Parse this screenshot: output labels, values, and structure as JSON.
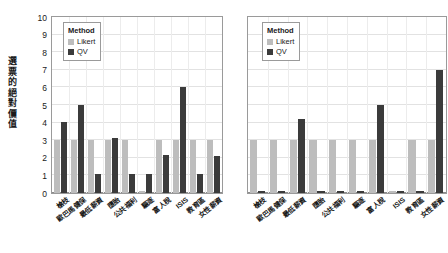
{
  "chart_data": [
    {
      "type": "bar",
      "panel": "left",
      "title": "",
      "xlabel": "",
      "ylabel": "選票的絕對價值",
      "ylim": [
        0,
        10
      ],
      "yticks": [
        0,
        1,
        2,
        3,
        4,
        5,
        6,
        7,
        8,
        9,
        10
      ],
      "grid": true,
      "legend": {
        "title": "Method",
        "position": "upper-left",
        "entries": [
          {
            "name": "Likert",
            "color": "#bdbdbd"
          },
          {
            "name": "QV",
            "color": "#3b3b3b"
          }
        ]
      },
      "categories": [
        "槍枝",
        "歐巴馬健保",
        "最低薪資",
        "墮胎",
        "公共福利",
        "驅逐",
        "富人稅",
        "ISIS",
        "教育區",
        "女性薪資"
      ],
      "series": [
        {
          "name": "Likert",
          "color": "#bdbdbd",
          "values": [
            3,
            3,
            3,
            3,
            3,
            0.1,
            3,
            3,
            3,
            3
          ]
        },
        {
          "name": "QV",
          "color": "#3b3b3b",
          "values": [
            4.05,
            5.0,
            1.1,
            3.1,
            1.1,
            1.1,
            2.15,
            6.05,
            1.1,
            2.1
          ]
        }
      ]
    },
    {
      "type": "bar",
      "panel": "right",
      "title": "",
      "xlabel": "",
      "ylabel": "",
      "ylim": [
        0,
        10
      ],
      "yticks": [],
      "grid": true,
      "legend": {
        "title": "Method",
        "position": "upper-left",
        "entries": [
          {
            "name": "Likert",
            "color": "#bdbdbd"
          },
          {
            "name": "QV",
            "color": "#3b3b3b"
          }
        ]
      },
      "categories": [
        "槍枝",
        "歐巴馬健保",
        "最低薪資",
        "墮胎",
        "公共福利",
        "驅逐",
        "富人稅",
        "ISIS",
        "教育區",
        "女性薪資"
      ],
      "series": [
        {
          "name": "Likert",
          "color": "#bdbdbd",
          "values": [
            3,
            3,
            3,
            3,
            3,
            3,
            3,
            0.1,
            3,
            3
          ]
        },
        {
          "name": "QV",
          "color": "#3b3b3b",
          "values": [
            0.12,
            0.12,
            4.2,
            0.12,
            0.12,
            0.12,
            5.0,
            0.12,
            0.12,
            7.0
          ]
        }
      ]
    }
  ]
}
